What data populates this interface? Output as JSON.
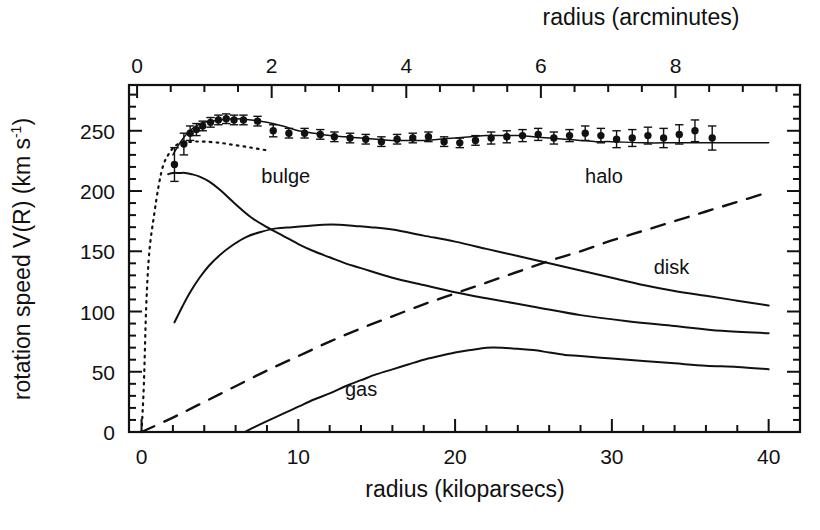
{
  "figure": {
    "name": "galaxy-rotation-curve",
    "background": "#ffffff",
    "ink_color": "#111111"
  },
  "axes": {
    "bottom": {
      "title": "radius (kiloparsecs)",
      "ticks": [
        0,
        10,
        20,
        30,
        40
      ],
      "tick_labels": [
        "0",
        "10",
        "20",
        "30",
        "40"
      ],
      "range": [
        -0.8,
        42.0
      ],
      "minor_tick_step": 2
    },
    "top": {
      "title": "radius (arcminutes)",
      "ticks": [
        0,
        2,
        4,
        6,
        8
      ],
      "tick_labels": [
        "0",
        "2",
        "4",
        "6",
        "8"
      ],
      "range": [
        -0.12,
        9.85
      ],
      "minor_tick_step": 0.5
    },
    "left": {
      "title_part1": "rotation speed V(R)  (km s",
      "title_exponent": "-1",
      "title_part3": ")",
      "title_full": "rotation speed V(R)  (km s-1)",
      "ticks": [
        0,
        50,
        100,
        150,
        200,
        250
      ],
      "tick_labels": [
        "0",
        "50",
        "100",
        "150",
        "200",
        "250"
      ],
      "range": [
        0,
        288
      ],
      "minor_tick_step": 10
    },
    "right": {
      "ticks_shown": true,
      "labels_shown": false
    }
  },
  "chart_data": {
    "type": "line",
    "title": "",
    "xlabel": "radius (kiloparsecs)",
    "ylabel": "rotation speed V(R)  (km s-1)",
    "xlabel_secondary": "radius (arcminutes)",
    "xlim": [
      -0.8,
      42.0
    ],
    "ylim": [
      0,
      288
    ],
    "grid": false,
    "legend": "inline-curve-labels",
    "annotations": [
      {
        "text": "bulge",
        "x": 9.2,
        "y": 207
      },
      {
        "text": "halo",
        "x": 29.5,
        "y": 207
      },
      {
        "text": "disk",
        "x": 33.8,
        "y": 131
      },
      {
        "text": "gas",
        "x": 14.0,
        "y": 30
      }
    ],
    "series": [
      {
        "name": "observed",
        "style": "points-with-errorbars",
        "marker": "filled-circle",
        "x": [
          2.1,
          2.7,
          3.1,
          3.5,
          3.9,
          4.4,
          4.9,
          5.4,
          5.9,
          6.5,
          7.4,
          8.4,
          9.4,
          10.4,
          11.4,
          12.3,
          13.3,
          14.3,
          15.3,
          16.3,
          17.3,
          18.3,
          19.3,
          20.3,
          21.3,
          22.3,
          23.3,
          24.3,
          25.3,
          26.3,
          27.3,
          28.3,
          29.3,
          30.3,
          31.3,
          32.3,
          33.3,
          34.3,
          35.3,
          36.4
        ],
        "y": [
          222,
          239,
          248,
          251,
          254,
          257,
          259,
          260,
          259,
          259,
          258,
          250,
          248,
          248,
          247,
          245,
          244,
          243,
          241,
          243,
          244,
          245,
          241,
          240,
          242,
          244,
          245,
          246,
          247,
          244,
          246,
          248,
          246,
          243,
          244,
          246,
          244,
          247,
          250,
          244
        ],
        "yerr": [
          14,
          9,
          6,
          5,
          4,
          4,
          4,
          4,
          4,
          4,
          4,
          5,
          4,
          4,
          4,
          4,
          4,
          4,
          4,
          4,
          4,
          4,
          4,
          4,
          4,
          5,
          5,
          5,
          5,
          5,
          5,
          6,
          6,
          7,
          7,
          7,
          8,
          8,
          9,
          10
        ]
      },
      {
        "name": "model-total",
        "style": "thin-solid",
        "x": [
          2.0,
          2.5,
          3.0,
          3.5,
          4.0,
          5.0,
          6.0,
          7.0,
          8.0,
          9.0,
          10.0,
          11.0,
          12.0,
          13.0,
          14.0,
          15.0,
          16.0,
          17.0,
          18.0,
          19.0,
          20.0,
          21.0,
          22.0,
          23.0,
          24.0,
          25.0,
          26.0,
          27.0,
          28.0,
          29.0,
          30.0,
          32.0,
          34.0,
          36.0,
          38.0,
          40.0
        ],
        "y": [
          230,
          241,
          249,
          254,
          257,
          259,
          260,
          259,
          257,
          254,
          250,
          248,
          246,
          245,
          244,
          243,
          242,
          242,
          242,
          243,
          244,
          245,
          246,
          246,
          246,
          245,
          244,
          243,
          242,
          241,
          241,
          240,
          240,
          240,
          240,
          240
        ]
      },
      {
        "name": "model-dotted",
        "style": "dotted",
        "x": [
          0.0,
          0.15,
          0.3,
          0.5,
          0.8,
          1.1,
          1.4,
          1.8,
          2.2,
          2.7,
          3.3,
          4.0,
          5.0,
          6.0,
          7.0,
          7.9
        ],
        "y": [
          0,
          40,
          105,
          150,
          180,
          205,
          222,
          232,
          238,
          240,
          241,
          241,
          240,
          238,
          236,
          234
        ]
      },
      {
        "name": "bulge",
        "style": "solid",
        "x": [
          1.7,
          2.0,
          2.4,
          2.8,
          3.2,
          3.7,
          4.3,
          5.0,
          6.0,
          7.0,
          8.0,
          9.0,
          10.0,
          11.0,
          12.0,
          13.0,
          14.0,
          16.0,
          18.0,
          20.0,
          22.0,
          25.0,
          28.0,
          31.0,
          34.0,
          37.0,
          40.0
        ],
        "y": [
          214,
          215,
          215,
          215,
          214,
          212,
          208,
          201,
          189,
          178,
          170,
          163,
          156,
          150,
          145,
          140,
          136,
          128,
          122,
          116,
          111,
          104,
          97,
          92,
          88,
          84,
          82
        ]
      },
      {
        "name": "disk",
        "style": "solid",
        "x": [
          2.1,
          2.6,
          3.1,
          3.7,
          4.3,
          5.0,
          5.8,
          6.7,
          7.6,
          8.6,
          9.6,
          10.6,
          11.6,
          12.6,
          13.6,
          14.6,
          16.0,
          18.0,
          20.0,
          22.0,
          24.0,
          26.0,
          28.0,
          30.0,
          32.0,
          34.0,
          36.0,
          38.0,
          40.0
        ],
        "y": [
          91,
          104,
          116,
          128,
          138,
          147,
          155,
          162,
          166,
          169,
          170,
          171,
          172,
          172,
          171,
          170,
          168,
          163,
          158,
          152,
          146,
          140,
          134,
          128,
          122,
          117,
          113,
          109,
          105
        ]
      },
      {
        "name": "halo",
        "style": "dashed",
        "x": [
          0.0,
          2.0,
          4.0,
          6.0,
          8.0,
          10.0,
          12.0,
          14.0,
          16.0,
          18.0,
          20.0,
          22.0,
          24.0,
          26.0,
          28.0,
          30.0,
          32.0,
          34.0,
          36.0,
          38.0,
          40.0
        ],
        "y": [
          0,
          12,
          25,
          38,
          51,
          63,
          75,
          86,
          96,
          106,
          115,
          124,
          133,
          142,
          150,
          159,
          167,
          175,
          183,
          191,
          199
        ]
      },
      {
        "name": "gas",
        "style": "solid",
        "x": [
          6.6,
          7.2,
          8.0,
          9.0,
          10.0,
          11.0,
          12.0,
          13.0,
          14.0,
          15.0,
          16.0,
          17.0,
          18.0,
          19.0,
          20.0,
          21.0,
          22.0,
          23.0,
          24.0,
          25.0,
          26.0,
          27.0,
          28.0,
          30.0,
          32.0,
          34.0,
          36.0,
          38.0,
          40.0
        ],
        "y": [
          0,
          4,
          9,
          15,
          21,
          27,
          32,
          38,
          43,
          48,
          52,
          56,
          60,
          63,
          66,
          68,
          70,
          70,
          69,
          68,
          66,
          64,
          63,
          61,
          59,
          57,
          55,
          54,
          52
        ]
      }
    ]
  }
}
